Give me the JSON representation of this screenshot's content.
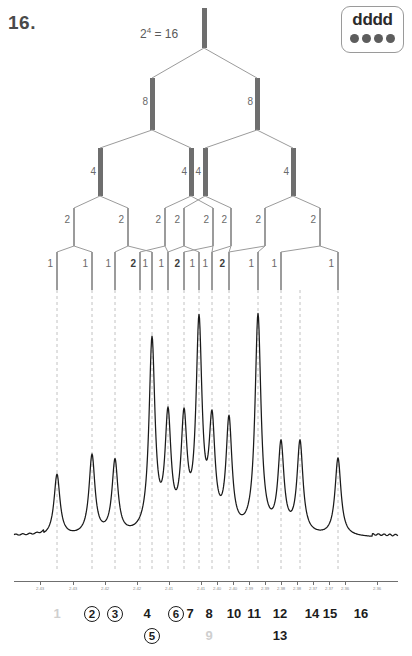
{
  "question_number": "16.",
  "power_label": "2⁴ = 16",
  "badge": {
    "text": "dddd",
    "dot_count": 4,
    "dot_color": "#5d5d5d"
  },
  "tree": {
    "title": "splitting-tree",
    "levels": [
      {
        "name": "root",
        "labels": [
          "16"
        ],
        "visible_labels": []
      },
      {
        "name": "level-8",
        "labels": [
          "8",
          "8"
        ]
      },
      {
        "name": "level-4",
        "labels": [
          "4",
          "4",
          "4",
          "4"
        ]
      },
      {
        "name": "level-2",
        "labels": [
          "2",
          "2",
          "2",
          "2",
          "2",
          "2",
          "2",
          "2"
        ]
      },
      {
        "name": "level-1",
        "labels": [
          "1",
          "1",
          "1",
          "2",
          "1",
          "1",
          "2",
          "1",
          "1",
          "2",
          "1",
          "1",
          "1"
        ]
      }
    ],
    "level8_x": [
      152,
      257
    ],
    "level4_x": [
      100,
      191,
      205,
      293
    ],
    "level2_x": [
      74,
      128,
      165,
      184,
      213,
      231,
      265,
      320
    ],
    "level1_x": [
      57,
      92,
      115,
      140,
      152,
      168,
      184,
      199,
      212,
      229,
      258,
      281,
      338
    ]
  },
  "chart_data": {
    "type": "line",
    "xlabel": "",
    "ylabel": "",
    "xlim": [
      2.435,
      2.355
    ],
    "grid": false,
    "legend": null,
    "axis_ticks": [
      "2.43",
      "2.43",
      "2.42",
      "2.42",
      "2.41",
      "2.41",
      "2.40",
      "2.40",
      "2.39",
      "2.39",
      "2.38",
      "2.38",
      "2.37",
      "2.37",
      "2.36",
      "2.36"
    ],
    "axis_tick_x": [
      40,
      73,
      105,
      137,
      169,
      201,
      217,
      233,
      249,
      265,
      281,
      297,
      313,
      329,
      345,
      377
    ],
    "peak_labels": [
      {
        "n": "1",
        "x": 57,
        "row": 1,
        "circled": false,
        "faint": true
      },
      {
        "n": "2",
        "x": 92,
        "row": 1,
        "circled": true,
        "faint": false
      },
      {
        "n": "3",
        "x": 115,
        "row": 1,
        "circled": true,
        "faint": false
      },
      {
        "n": "4",
        "x": 147,
        "row": 1,
        "circled": false,
        "faint": false
      },
      {
        "n": "5",
        "x": 152,
        "row": 2,
        "circled": true,
        "faint": false
      },
      {
        "n": "6",
        "x": 176,
        "row": 1,
        "circled": true,
        "faint": false
      },
      {
        "n": "7",
        "x": 190,
        "row": 1,
        "circled": false,
        "faint": false
      },
      {
        "n": "8",
        "x": 209,
        "row": 1,
        "circled": false,
        "faint": false
      },
      {
        "n": "9",
        "x": 209,
        "row": 2,
        "circled": false,
        "faint": true
      },
      {
        "n": "10",
        "x": 234,
        "row": 1,
        "circled": false,
        "faint": false
      },
      {
        "n": "11",
        "x": 254,
        "row": 1,
        "circled": false,
        "faint": false
      },
      {
        "n": "12",
        "x": 280,
        "row": 1,
        "circled": false,
        "faint": false
      },
      {
        "n": "13",
        "x": 280,
        "row": 2,
        "circled": false,
        "faint": false
      },
      {
        "n": "14",
        "x": 312,
        "row": 1,
        "circled": false,
        "faint": false
      },
      {
        "n": "15",
        "x": 330,
        "row": 1,
        "circled": false,
        "faint": false
      },
      {
        "n": "16",
        "x": 361,
        "row": 1,
        "circled": false,
        "faint": false
      }
    ],
    "peaks": [
      {
        "index": 1,
        "x": 57,
        "height": 62,
        "intensity": 1
      },
      {
        "index": 2,
        "x": 92,
        "height": 80,
        "intensity": 1
      },
      {
        "index": 3,
        "x": 115,
        "height": 74,
        "intensity": 1
      },
      {
        "index": 4,
        "x": 140,
        "height": 0,
        "intensity": 0
      },
      {
        "index": 5,
        "x": 152,
        "height": 192,
        "intensity": 2
      },
      {
        "index": 6,
        "x": 168,
        "height": 112,
        "intensity": 1
      },
      {
        "index": 7,
        "x": 184,
        "height": 108,
        "intensity": 1
      },
      {
        "index": 8,
        "x": 199,
        "height": 205,
        "intensity": 2
      },
      {
        "index": 9,
        "x": 212,
        "height": 104,
        "intensity": 1
      },
      {
        "index": 10,
        "x": 229,
        "height": 110,
        "intensity": 1
      },
      {
        "index": 11,
        "x": 258,
        "height": 218,
        "intensity": 2
      },
      {
        "index": 12,
        "x": 281,
        "height": 88,
        "intensity": 1
      },
      {
        "index": 13,
        "x": 300,
        "height": 92,
        "intensity": 1
      },
      {
        "index": 14,
        "x": 338,
        "height": 78,
        "intensity": 1
      }
    ],
    "guide_lines_x": [
      57,
      92,
      115,
      140,
      152,
      168,
      184,
      199,
      212,
      229,
      258,
      281,
      300,
      338
    ]
  }
}
